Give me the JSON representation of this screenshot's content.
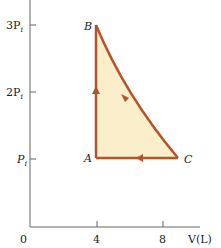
{
  "diagram": {
    "type": "PV diagram",
    "axes": {
      "x_label": "V(L)",
      "y_ticks": [
        {
          "label": "3P",
          "sub": "i",
          "value": 3
        },
        {
          "label": "2P",
          "sub": "i",
          "value": 2
        },
        {
          "label": "P",
          "sub": "i",
          "value": 1
        }
      ],
      "x_ticks": [
        {
          "label": "4",
          "value": 4
        },
        {
          "label": "8",
          "value": 8
        }
      ],
      "origin_label": "0"
    },
    "points": [
      {
        "name": "A",
        "V": 4,
        "P": 1
      },
      {
        "name": "B",
        "V": 4,
        "P": 3
      },
      {
        "name": "C",
        "V": 9,
        "P": 1
      }
    ],
    "process_path": [
      "A",
      "B",
      "C",
      "A"
    ],
    "colors": {
      "path": "#b5532a",
      "fill": "#fbeecb",
      "axis": "#555555"
    }
  }
}
